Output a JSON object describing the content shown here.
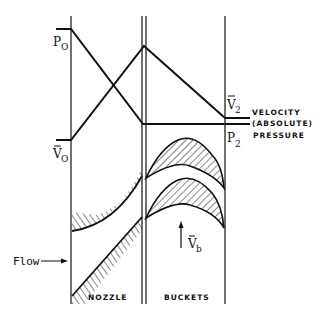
{
  "labels": {
    "p0_main": "P",
    "p0_sub": "O",
    "v0_main": "V",
    "v0_sub": "O",
    "v2_main": "V",
    "v2_sub": "2",
    "p2_main": "P",
    "p2_sub": "2",
    "vb_main": "V",
    "vb_sub": "b",
    "velocity_line1": "VELOCITY",
    "velocity_line2": "(ABSOLUTE)",
    "pressure": "PRESSURE",
    "flow": "Flow",
    "nozzle": "NOZZLE",
    "buckets": "BUCKETS"
  },
  "colors": {
    "ink": "#111111",
    "background": "#ffffff"
  }
}
